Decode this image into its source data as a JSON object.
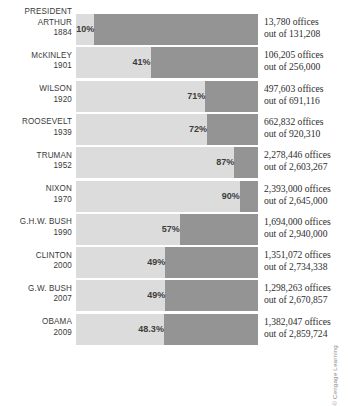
{
  "chart_data": {
    "type": "bar",
    "title": "",
    "subtitle": "",
    "xlabel": "",
    "ylabel": "",
    "orientation": "horizontal",
    "grid": false,
    "legend": null,
    "xlim": [
      0,
      100
    ],
    "header_label": "PRESIDENT",
    "categories": [
      "ARTHUR 1884",
      "McKINLEY 1901",
      "WILSON 1920",
      "ROOSEVELT 1939",
      "TRUMAN 1952",
      "NIXON 1970",
      "G.H.W. BUSH 1990",
      "CLINTON 2000",
      "G.W. BUSH 2007",
      "OBAMA 2009"
    ],
    "values": [
      10,
      41,
      71,
      72,
      87,
      90,
      57,
      49,
      49,
      48.3
    ],
    "value_labels": [
      "10%",
      "41%",
      "71%",
      "72%",
      "87%",
      "90%",
      "57%",
      "49%",
      "49%",
      "48.3%"
    ],
    "annotations": [
      "13,780 offices out of 131,208",
      "106,205 offices out of 256,000",
      "497,603 offices out of 691,116",
      "662,832 offices out of 920,310",
      "2,278,446 offices out of 2,603,267",
      "2,393,000 offices out of 2,645,000",
      "1,694,000 offices out of 2,940,000",
      "1,351,072 offices out of 2,734,338",
      "1,298,263 offices out of 2,670,857",
      "1,382,047 offices out of 2,859,724"
    ],
    "colors": {
      "filled": "#dcdcdc",
      "remainder": "#949494",
      "background": "#ffffff",
      "text": "#2e2e2e"
    }
  },
  "rows": [
    {
      "header": "PRESIDENT",
      "name": "ARTHUR",
      "year": "1884",
      "pct_label": "10%",
      "pct": 10,
      "numerator": "13,780 offices",
      "denominator": "out of 131,208"
    },
    {
      "header": "",
      "name": "McKINLEY",
      "year": "1901",
      "pct_label": "41%",
      "pct": 41,
      "numerator": "106,205 offices",
      "denominator": "out of 256,000"
    },
    {
      "header": "",
      "name": "WILSON",
      "year": "1920",
      "pct_label": "71%",
      "pct": 71,
      "numerator": "497,603 offices",
      "denominator": "out of 691,116"
    },
    {
      "header": "",
      "name": "ROOSEVELT",
      "year": "1939",
      "pct_label": "72%",
      "pct": 72,
      "numerator": "662,832 offices",
      "denominator": "out of 920,310"
    },
    {
      "header": "",
      "name": "TRUMAN",
      "year": "1952",
      "pct_label": "87%",
      "pct": 87,
      "numerator": "2,278,446 offices",
      "denominator": "out of 2,603,267"
    },
    {
      "header": "",
      "name": "NIXON",
      "year": "1970",
      "pct_label": "90%",
      "pct": 90,
      "numerator": "2,393,000 offices",
      "denominator": "out of 2,645,000"
    },
    {
      "header": "",
      "name": "G.H.W. BUSH",
      "year": "1990",
      "pct_label": "57%",
      "pct": 57,
      "numerator": "1,694,000 offices",
      "denominator": "out of 2,940,000"
    },
    {
      "header": "",
      "name": "CLINTON",
      "year": "2000",
      "pct_label": "49%",
      "pct": 49,
      "numerator": "1,351,072 offices",
      "denominator": "out of 2,734,338"
    },
    {
      "header": "",
      "name": "G.W. BUSH",
      "year": "2007",
      "pct_label": "49%",
      "pct": 49,
      "numerator": "1,298,263 offices",
      "denominator": "out of 2,670,857"
    },
    {
      "header": "",
      "name": "OBAMA",
      "year": "2009",
      "pct_label": "48.3%",
      "pct": 48.3,
      "numerator": "1,382,047 offices",
      "denominator": "out of 2,859,724"
    }
  ],
  "credit": "© Cengage Learning"
}
